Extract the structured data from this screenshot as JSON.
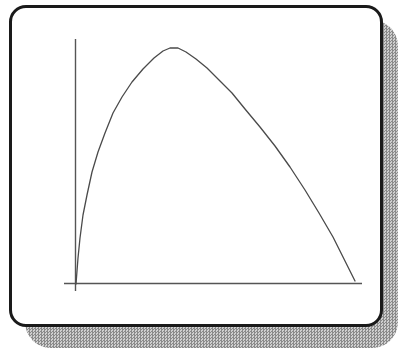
{
  "window": {
    "panel_bg": "#ffffff",
    "panel_border_color": "#1a1a1a",
    "shadow_dark": "#8a8a8a",
    "shadow_light": "#cfcfcf",
    "axis_color": "#555555",
    "curve_color": "#4a4a4a"
  },
  "chart_data": {
    "type": "line",
    "title": "",
    "subtitle": "",
    "xlabel": "",
    "ylabel": "",
    "tick_labels": "none visible",
    "grid": false,
    "legend": false,
    "xlim": [
      0,
      1
    ],
    "ylim": [
      0,
      1
    ],
    "peak": {
      "x": 0.34,
      "y": 1.0
    },
    "x_normalized": [
      0.0,
      0.007,
      0.014,
      0.025,
      0.039,
      0.057,
      0.079,
      0.104,
      0.133,
      0.165,
      0.201,
      0.24,
      0.28,
      0.312,
      0.337,
      0.366,
      0.394,
      0.43,
      0.47,
      0.513,
      0.559,
      0.606,
      0.659,
      0.713,
      0.767,
      0.821,
      0.871,
      0.921,
      0.961,
      1.0
    ],
    "y_normalized": [
      0.0,
      0.108,
      0.193,
      0.291,
      0.376,
      0.473,
      0.558,
      0.639,
      0.724,
      0.792,
      0.856,
      0.911,
      0.957,
      0.987,
      1.0,
      1.0,
      0.983,
      0.953,
      0.915,
      0.864,
      0.809,
      0.741,
      0.664,
      0.584,
      0.495,
      0.397,
      0.299,
      0.197,
      0.104,
      0.011
    ],
    "pixel_geometry": {
      "x_axis": {
        "x1": 64,
        "y1": 283.5,
        "x2": 362,
        "y2": 283.5
      },
      "y_axis": {
        "x1": 75.5,
        "y1": 39,
        "x2": 75.5,
        "y2": 291
      },
      "curve_points": [
        [
          76,
          284
        ],
        [
          78,
          258
        ],
        [
          80,
          238
        ],
        [
          83,
          215
        ],
        [
          87,
          195
        ],
        [
          92,
          172
        ],
        [
          98,
          152
        ],
        [
          105,
          133
        ],
        [
          113,
          113
        ],
        [
          122,
          97
        ],
        [
          132,
          82
        ],
        [
          143,
          69
        ],
        [
          154,
          58
        ],
        [
          163,
          51
        ],
        [
          170,
          48
        ],
        [
          178,
          48
        ],
        [
          186,
          52
        ],
        [
          196,
          59
        ],
        [
          207,
          68
        ],
        [
          219,
          80
        ],
        [
          232,
          93
        ],
        [
          245,
          109
        ],
        [
          260,
          127
        ],
        [
          275,
          146
        ],
        [
          290,
          167
        ],
        [
          305,
          190
        ],
        [
          319,
          213
        ],
        [
          333,
          237
        ],
        [
          344,
          259
        ],
        [
          355,
          281
        ]
      ]
    }
  }
}
